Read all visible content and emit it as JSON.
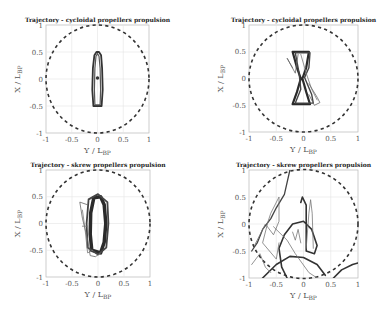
{
  "chart_data": [
    {
      "type": "line",
      "title": "Trajectory - cycloidal propellers propulsion",
      "xlabel": "Y / L",
      "xlabel_sub": "BP",
      "ylabel": "X / L",
      "ylabel_sub": "BP",
      "xlim": [
        -1,
        1
      ],
      "ylim": [
        -1,
        1
      ],
      "xticks": [
        "-1",
        "-0.5",
        "0",
        "0.5",
        "1"
      ],
      "yticks": [
        "-1",
        "-0.5",
        "0",
        "0.5",
        "1"
      ],
      "grid": true,
      "reference_circle": {
        "radius": 1,
        "style": "dashed"
      },
      "box": {
        "x0": 46,
        "y0": 25,
        "x1": 149,
        "y1": 133
      },
      "series": [
        {
          "name": "trajectory-loop-outer",
          "color": "#333333",
          "width": 1.8,
          "points": [
            [
              -0.08,
              -0.5
            ],
            [
              -0.1,
              -0.2
            ],
            [
              -0.09,
              0.2
            ],
            [
              -0.06,
              0.44
            ],
            [
              -0.02,
              0.5
            ],
            [
              0.03,
              0.5
            ],
            [
              0.07,
              0.44
            ],
            [
              0.09,
              0.2
            ],
            [
              0.1,
              -0.2
            ],
            [
              0.08,
              -0.5
            ],
            [
              -0.08,
              -0.5
            ]
          ]
        },
        {
          "name": "trajectory-loop-inner",
          "color": "#555555",
          "width": 1.2,
          "points": [
            [
              -0.05,
              -0.48
            ],
            [
              -0.06,
              -0.2
            ],
            [
              -0.05,
              0.2
            ],
            [
              -0.03,
              0.42
            ],
            [
              0.0,
              0.47
            ],
            [
              0.03,
              0.42
            ],
            [
              0.05,
              0.2
            ],
            [
              0.06,
              -0.2
            ],
            [
              0.05,
              -0.48
            ],
            [
              -0.05,
              -0.48
            ]
          ]
        },
        {
          "name": "start-point",
          "color": "#333333",
          "width": 2.5,
          "marker": true,
          "points": [
            [
              0.0,
              0.02
            ]
          ]
        }
      ]
    },
    {
      "type": "line",
      "title": "Trajectory - cycloidal propellers propulsion",
      "xlabel": "Y / L",
      "xlabel_sub": "BP",
      "ylabel": "X / L",
      "ylabel_sub": "BP",
      "xlim": [
        -1,
        1
      ],
      "ylim": [
        -1,
        1
      ],
      "xticks": [
        "-1",
        "-0.5",
        "0",
        "0.5",
        "1"
      ],
      "yticks": [
        "-1",
        "-0.5",
        "0",
        "0.5",
        "1"
      ],
      "grid": true,
      "reference_circle": {
        "radius": 1,
        "style": "dashed"
      },
      "box": {
        "x0": 249,
        "y0": 25,
        "x1": 358,
        "y1": 132
      },
      "series": [
        {
          "name": "trajectory-bowtie-main",
          "color": "#2a2a2a",
          "width": 2.2,
          "points": [
            [
              -0.2,
              0.5
            ],
            [
              0.1,
              0.5
            ],
            [
              0.05,
              0.2
            ],
            [
              -0.02,
              0.0
            ],
            [
              0.05,
              -0.25
            ],
            [
              0.12,
              -0.48
            ],
            [
              -0.2,
              -0.48
            ],
            [
              -0.12,
              -0.25
            ],
            [
              -0.05,
              0.0
            ],
            [
              -0.12,
              0.2
            ],
            [
              -0.2,
              0.5
            ]
          ]
        },
        {
          "name": "trajectory-bowtie-2",
          "color": "#444444",
          "width": 1.4,
          "points": [
            [
              -0.15,
              0.48
            ],
            [
              0.12,
              0.48
            ],
            [
              0.1,
              0.2
            ],
            [
              0.02,
              0.02
            ],
            [
              0.15,
              -0.3
            ],
            [
              0.18,
              -0.46
            ],
            [
              -0.15,
              -0.46
            ],
            [
              -0.05,
              -0.2
            ],
            [
              -0.08,
              0.1
            ],
            [
              -0.15,
              0.48
            ]
          ]
        },
        {
          "name": "trajectory-excursion-left",
          "color": "#666666",
          "width": 0.8,
          "points": [
            [
              -0.2,
              0.2
            ],
            [
              -0.3,
              0.38
            ],
            [
              -0.15,
              0.1
            ],
            [
              -0.1,
              0.45
            ]
          ]
        },
        {
          "name": "trajectory-excursion-right",
          "color": "#666666",
          "width": 0.8,
          "points": [
            [
              0.1,
              -0.1
            ],
            [
              0.25,
              -0.35
            ],
            [
              0.3,
              -0.45
            ],
            [
              0.2,
              -0.5
            ],
            [
              0.1,
              -0.3
            ]
          ]
        },
        {
          "name": "trajectory-inner-arc",
          "color": "#777777",
          "width": 0.8,
          "points": [
            [
              -0.05,
              0.45
            ],
            [
              0.05,
              0.1
            ],
            [
              0.15,
              -0.2
            ],
            [
              0.25,
              -0.4
            ]
          ]
        }
      ]
    },
    {
      "type": "line",
      "title": "Trajectory - skrew propellers propulsion",
      "xlabel": "Y / L",
      "xlabel_sub": "BP",
      "ylabel": "X / L",
      "ylabel_sub": "BP",
      "xlim": [
        -1,
        1
      ],
      "ylim": [
        -1,
        1
      ],
      "xticks": [
        "-1",
        "-0.5",
        "0",
        "0.5",
        "1"
      ],
      "yticks": [
        "-1",
        "-0.5",
        "0",
        "0.5",
        "1"
      ],
      "grid": true,
      "reference_circle": {
        "radius": 1,
        "style": "dashed"
      },
      "box": {
        "x0": 46,
        "y0": 170,
        "x1": 150,
        "y1": 277
      },
      "series": [
        {
          "name": "trajectory-dense-core",
          "color": "#2a2a2a",
          "width": 3.5,
          "points": [
            [
              -0.12,
              -0.5
            ],
            [
              -0.15,
              -0.2
            ],
            [
              -0.14,
              0.2
            ],
            [
              -0.08,
              0.48
            ],
            [
              0.05,
              0.5
            ],
            [
              0.12,
              0.35
            ],
            [
              0.15,
              0.0
            ],
            [
              0.12,
              -0.35
            ],
            [
              0.05,
              -0.55
            ],
            [
              -0.12,
              -0.5
            ]
          ]
        },
        {
          "name": "trajectory-core-2",
          "color": "#444444",
          "width": 1.8,
          "points": [
            [
              -0.2,
              -0.45
            ],
            [
              -0.22,
              0.0
            ],
            [
              -0.18,
              0.45
            ],
            [
              0.0,
              0.55
            ],
            [
              0.18,
              0.4
            ],
            [
              0.2,
              0.0
            ],
            [
              0.16,
              -0.45
            ],
            [
              0.0,
              -0.58
            ],
            [
              -0.2,
              -0.45
            ]
          ]
        },
        {
          "name": "trajectory-excursion-left",
          "color": "#666666",
          "width": 0.8,
          "points": [
            [
              -0.2,
              0.35
            ],
            [
              -0.35,
              0.4
            ],
            [
              -0.3,
              0.1
            ],
            [
              -0.2,
              -0.3
            ],
            [
              -0.15,
              -0.6
            ],
            [
              -0.05,
              -0.62
            ],
            [
              0.05,
              -0.55
            ]
          ]
        },
        {
          "name": "trajectory-excursion-inner",
          "color": "#777777",
          "width": 0.8,
          "points": [
            [
              -0.3,
              0.25
            ],
            [
              -0.25,
              -0.1
            ],
            [
              -0.2,
              -0.55
            ],
            [
              -0.1,
              -0.5
            ]
          ]
        },
        {
          "name": "trajectory-tick-left",
          "color": "#777777",
          "width": 0.8,
          "points": [
            [
              -0.3,
              -0.05
            ],
            [
              -0.2,
              -0.05
            ]
          ]
        }
      ]
    },
    {
      "type": "line",
      "title": "Trajectory - skrew propellers propulsion",
      "xlabel": "Y / L",
      "xlabel_sub": "BP",
      "ylabel": "X / L",
      "ylabel_sub": "BP",
      "xlim": [
        -1,
        1
      ],
      "ylim": [
        -1,
        1
      ],
      "xticks": [
        "-1",
        "-0.5",
        "0",
        "0.5",
        "1"
      ],
      "yticks": [
        "-1",
        "-0.5",
        "0",
        "0.5",
        "1"
      ],
      "grid": true,
      "reference_circle": {
        "radius": 1,
        "style": "dashed"
      },
      "box": {
        "x0": 249,
        "y0": 170,
        "x1": 358,
        "y1": 278
      },
      "series": [
        {
          "name": "trajectory-long-diagonal",
          "color": "#444444",
          "width": 1.3,
          "points": [
            [
              -0.25,
              1.0
            ],
            [
              -0.35,
              0.55
            ],
            [
              -0.5,
              0.3
            ],
            [
              -0.6,
              0.1
            ],
            [
              -0.75,
              -0.1
            ],
            [
              -0.85,
              -0.35
            ],
            [
              -0.95,
              -0.5
            ]
          ]
        },
        {
          "name": "trajectory-loop-center",
          "color": "#333333",
          "width": 1.6,
          "points": [
            [
              -0.05,
              0.4
            ],
            [
              -0.02,
              0.5
            ],
            [
              0.05,
              0.35
            ],
            [
              0.05,
              -0.5
            ],
            [
              0.2,
              -0.55
            ],
            [
              0.25,
              -0.4
            ],
            [
              0.15,
              -0.1
            ],
            [
              0.0,
              0.05
            ],
            [
              -0.2,
              0.0
            ],
            [
              -0.35,
              -0.2
            ],
            [
              -0.45,
              -0.45
            ],
            [
              -0.4,
              -0.8
            ],
            [
              -0.3,
              -1.0
            ]
          ]
        },
        {
          "name": "trajectory-narrow-spike",
          "color": "#777777",
          "width": 0.8,
          "points": [
            [
              0.05,
              -0.45
            ],
            [
              0.1,
              0.2
            ],
            [
              0.13,
              0.45
            ],
            [
              0.16,
              0.2
            ],
            [
              0.18,
              -0.45
            ]
          ]
        },
        {
          "name": "trajectory-zigzag-left",
          "color": "#777777",
          "width": 0.8,
          "points": [
            [
              -0.9,
              -0.4
            ],
            [
              -0.7,
              0.0
            ],
            [
              -0.55,
              -0.2
            ],
            [
              -0.45,
              0.05
            ],
            [
              -0.45,
              0.5
            ],
            [
              -0.6,
              0.2
            ],
            [
              -0.65,
              0.05
            ],
            [
              -0.75,
              -0.35
            ],
            [
              -0.5,
              -0.65
            ],
            [
              -0.45,
              -0.35
            ]
          ]
        },
        {
          "name": "trajectory-arc-bottom",
          "color": "#333333",
          "width": 1.6,
          "points": [
            [
              -0.75,
              -1.0
            ],
            [
              -0.5,
              -0.75
            ],
            [
              -0.25,
              -0.6
            ],
            [
              0.0,
              -0.62
            ],
            [
              0.25,
              -0.75
            ],
            [
              0.4,
              -0.95
            ]
          ]
        },
        {
          "name": "trajectory-diagonal-right",
          "color": "#777777",
          "width": 0.8,
          "points": [
            [
              -0.55,
              -0.05
            ],
            [
              -0.3,
              -0.3
            ],
            [
              -0.15,
              -0.55
            ],
            [
              0.1,
              -0.9
            ],
            [
              0.25,
              -1.0
            ]
          ]
        },
        {
          "name": "trajectory-corner-arc",
          "color": "#333333",
          "width": 1.6,
          "points": [
            [
              0.55,
              -1.0
            ],
            [
              0.7,
              -0.85
            ],
            [
              0.9,
              -0.75
            ],
            [
              1.0,
              -0.72
            ]
          ]
        },
        {
          "name": "trajectory-bottom-left-spike",
          "color": "#777777",
          "width": 0.8,
          "points": [
            [
              -0.95,
              -0.75
            ],
            [
              -0.8,
              -0.55
            ],
            [
              -0.7,
              -0.8
            ],
            [
              -0.6,
              -0.9
            ]
          ]
        },
        {
          "name": "trajectory-small-cross",
          "color": "#777777",
          "width": 0.8,
          "points": [
            [
              -0.2,
              -0.15
            ],
            [
              -0.15,
              -0.3
            ],
            [
              -0.1,
              -0.1
            ],
            [
              -0.05,
              -0.35
            ]
          ]
        }
      ]
    }
  ]
}
